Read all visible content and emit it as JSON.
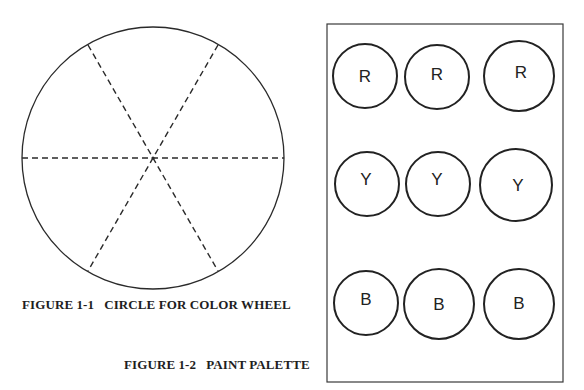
{
  "figure1": {
    "caption": "FIGURE 1-1   CIRCLE FOR COLOR WHEEL",
    "wheel": {
      "center": [
        153,
        158
      ],
      "radius": 131,
      "segments": 6,
      "divider_style": "dashed"
    }
  },
  "figure2": {
    "caption": "FIGURE 1-2   PAINT PALETTE",
    "palette": {
      "rows": [
        {
          "color": "Red",
          "wells": [
            {
              "label": "R",
              "cx": 365,
              "cy": 76,
              "r": 32
            },
            {
              "label": "R",
              "cx": 437,
              "cy": 77,
              "r": 32
            },
            {
              "label": "R",
              "cx": 519,
              "cy": 76,
              "r": 35
            }
          ]
        },
        {
          "color": "Yellow",
          "wells": [
            {
              "label": "Y",
              "cx": 367,
              "cy": 184,
              "r": 32
            },
            {
              "label": "Y",
              "cx": 438,
              "cy": 184,
              "r": 32
            },
            {
              "label": "Y",
              "cx": 516,
              "cy": 185,
              "r": 36
            }
          ]
        },
        {
          "color": "Blue",
          "wells": [
            {
              "label": "B",
              "cx": 366,
              "cy": 303,
              "r": 32
            },
            {
              "label": "B",
              "cx": 439,
              "cy": 304,
              "r": 35
            },
            {
              "label": "B",
              "cx": 519,
              "cy": 304,
              "r": 35
            }
          ]
        }
      ]
    }
  },
  "colors": {
    "ink": "#2a2a2a",
    "background": "#ffffff"
  }
}
